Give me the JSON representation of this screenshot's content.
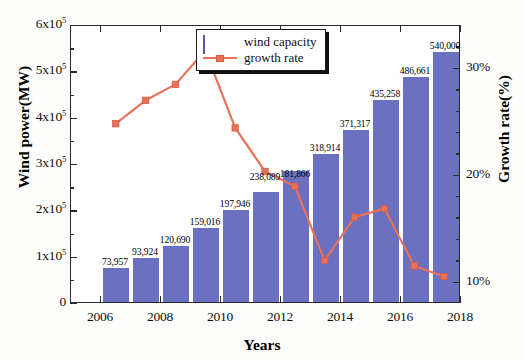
{
  "chart_data": {
    "type": "bar",
    "title": "",
    "xlabel": "Years",
    "ylabel": "Wind power(MW)",
    "ylabel_right": "Growth rate(%)",
    "x": [
      2006,
      2007,
      2008,
      2009,
      2010,
      2011,
      2012,
      2013,
      2014,
      2015,
      2016,
      2017
    ],
    "categories": [
      "2006",
      "2007",
      "2008",
      "2009",
      "2010",
      "2011",
      "2012",
      "2013",
      "2014",
      "2015",
      "2016",
      "2017"
    ],
    "xlim": [
      2005,
      2018
    ],
    "xticks": [
      "2006",
      "2008",
      "2010",
      "2012",
      "2014",
      "2016",
      "2018"
    ],
    "ylim": [
      0,
      600000
    ],
    "yticks": [
      "0",
      "1x10⁵",
      "2x10⁵",
      "3x10⁵",
      "4x10⁵",
      "5x10⁵",
      "6x10⁵"
    ],
    "ylim_right": [
      8,
      34
    ],
    "yticks_right": [
      "10%",
      "20%",
      "30%"
    ],
    "grid": false,
    "legend_position": "top-center",
    "series": [
      {
        "name": "wind capacity",
        "type": "bar",
        "color": "#6b70c0",
        "axis": "left",
        "values": [
          73957,
          93924,
          120690,
          159016,
          197946,
          238089,
          283194,
          318914,
          371317,
          435258,
          486661,
          540000
        ],
        "data_labels": [
          "73,957",
          "93,924",
          "120,690",
          "159,016",
          "197,946",
          "238,089",
          "181,866",
          "318,914",
          "371,317",
          "435,258",
          "486,661",
          "540,000"
        ]
      },
      {
        "name": "growth rate",
        "type": "line",
        "color": "#e8715a",
        "axis": "right",
        "values": [
          24.8,
          27.0,
          28.5,
          31.7,
          24.4,
          20.3,
          18.9,
          11.9,
          16.0,
          16.8,
          11.4,
          10.4
        ]
      }
    ]
  },
  "legend": {
    "items": [
      {
        "label": "wind capacity",
        "marker": "bar-swatch",
        "color": "#6b70c0"
      },
      {
        "label": "growth rate",
        "marker": "line-square",
        "color": "#e8715a"
      }
    ]
  },
  "axes": {
    "left_title": "Wind power(MW)",
    "right_title": "Growth rate(%)",
    "bottom_title": "Years",
    "left_ticks": [
      {
        "text": "0",
        "value": 0
      },
      {
        "text": "1x10",
        "exp": "5",
        "value": 100000
      },
      {
        "text": "2x10",
        "exp": "5",
        "value": 200000
      },
      {
        "text": "3x10",
        "exp": "5",
        "value": 300000
      },
      {
        "text": "4x10",
        "exp": "5",
        "value": 400000
      },
      {
        "text": "5x10",
        "exp": "5",
        "value": 500000
      },
      {
        "text": "6x10",
        "exp": "5",
        "value": 600000
      }
    ],
    "right_ticks": [
      {
        "text": "10%",
        "value": 10
      },
      {
        "text": "20%",
        "value": 20
      },
      {
        "text": "30%",
        "value": 30
      }
    ],
    "bottom_ticks": [
      {
        "text": "2006",
        "value": 2006
      },
      {
        "text": "2008",
        "value": 2008
      },
      {
        "text": "2010",
        "value": 2010
      },
      {
        "text": "2012",
        "value": 2012
      },
      {
        "text": "2014",
        "value": 2014
      },
      {
        "text": "2016",
        "value": 2016
      },
      {
        "text": "2018",
        "value": 2018
      }
    ]
  }
}
